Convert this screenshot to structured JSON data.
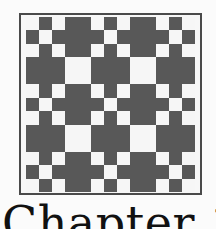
{
  "figure": {
    "name": "quilt-block-illustration",
    "grid_size": 13,
    "colors": {
      "dark": "#585858",
      "light": "#f6f6f6",
      "frame": "#4a4a4a",
      "background": "#fbfbfb"
    },
    "row_patterns": {
      "chain_a_light_cols": [
        0,
        2,
        5,
        7,
        10,
        12
      ],
      "chain_b_light_cols": [
        1,
        6,
        11
      ],
      "block_light_cols": [
        3,
        4,
        8,
        9
      ]
    },
    "rows": [
      "chain_a",
      "chain_b",
      "chain_a",
      "block",
      "block",
      "chain_a",
      "chain_b",
      "chain_a",
      "block",
      "block",
      "chain_a",
      "chain_b",
      "chain_a"
    ]
  },
  "heading": {
    "text": "Chapter 1"
  }
}
